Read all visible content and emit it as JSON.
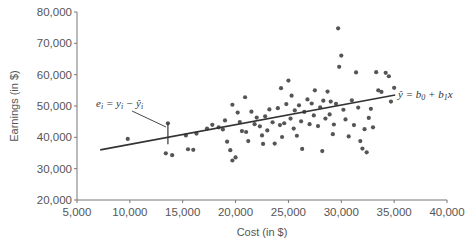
{
  "chart_data": {
    "type": "scatter",
    "title": "",
    "xlabel": "Cost (in $)",
    "ylabel": "Earnings (in $)",
    "xlim": [
      5000,
      40000
    ],
    "ylim": [
      20000,
      80000
    ],
    "x_ticks": [
      "5,000",
      "10,000",
      "15,000",
      "20,000",
      "25,000",
      "30,000",
      "35,000",
      "40,000"
    ],
    "y_ticks": [
      "80,000",
      "70,000",
      "60,000",
      "50,000",
      "40,000",
      "30,000",
      "20,000"
    ],
    "grid": false,
    "legend": null,
    "regression_line": {
      "label": "ŷ = b0 + b1x",
      "x": [
        7200,
        35100
      ],
      "y": [
        36000,
        53500
      ]
    },
    "residual_annotation": {
      "label": "ei = yi − ŷi",
      "x": 13600,
      "y_obs": 44500,
      "y_hat": 37800
    },
    "points": [
      [
        9800,
        39500
      ],
      [
        13600,
        44500
      ],
      [
        13400,
        34900
      ],
      [
        14000,
        34300
      ],
      [
        15500,
        36200
      ],
      [
        15300,
        40600
      ],
      [
        16300,
        41200
      ],
      [
        16000,
        36000
      ],
      [
        17300,
        42800
      ],
      [
        17800,
        44000
      ],
      [
        18400,
        43200
      ],
      [
        18800,
        42500
      ],
      [
        19000,
        45400
      ],
      [
        19200,
        38600
      ],
      [
        19500,
        35900
      ],
      [
        19700,
        32600
      ],
      [
        20000,
        33600
      ],
      [
        19700,
        50400
      ],
      [
        20200,
        47900
      ],
      [
        20400,
        44900
      ],
      [
        20600,
        42000
      ],
      [
        20900,
        52800
      ],
      [
        21000,
        41700
      ],
      [
        21200,
        38800
      ],
      [
        21500,
        48200
      ],
      [
        21800,
        44200
      ],
      [
        22000,
        46300
      ],
      [
        22300,
        43500
      ],
      [
        22500,
        40600
      ],
      [
        22600,
        37900
      ],
      [
        22800,
        46700
      ],
      [
        23000,
        42200
      ],
      [
        23200,
        48900
      ],
      [
        23500,
        44800
      ],
      [
        23700,
        38000
      ],
      [
        24000,
        49300
      ],
      [
        24200,
        43900
      ],
      [
        24300,
        55700
      ],
      [
        24400,
        40100
      ],
      [
        24600,
        44500
      ],
      [
        24800,
        50600
      ],
      [
        25000,
        58100
      ],
      [
        25200,
        46000
      ],
      [
        25300,
        53300
      ],
      [
        25500,
        42800
      ],
      [
        25600,
        48600
      ],
      [
        25800,
        40500
      ],
      [
        26000,
        50200
      ],
      [
        26200,
        45100
      ],
      [
        26300,
        36300
      ],
      [
        26500,
        48100
      ],
      [
        26800,
        52100
      ],
      [
        27000,
        44200
      ],
      [
        27200,
        50800
      ],
      [
        27400,
        47000
      ],
      [
        27500,
        55000
      ],
      [
        27800,
        43600
      ],
      [
        28000,
        49600
      ],
      [
        28200,
        35600
      ],
      [
        28300,
        51700
      ],
      [
        28500,
        46000
      ],
      [
        28700,
        54600
      ],
      [
        28900,
        47300
      ],
      [
        29000,
        51400
      ],
      [
        29200,
        41000
      ],
      [
        29300,
        44100
      ],
      [
        29500,
        50700
      ],
      [
        29700,
        74800
      ],
      [
        29800,
        62500
      ],
      [
        30000,
        66100
      ],
      [
        30200,
        48800
      ],
      [
        30400,
        45700
      ],
      [
        30700,
        40300
      ],
      [
        31000,
        51800
      ],
      [
        31200,
        43900
      ],
      [
        31400,
        60700
      ],
      [
        31600,
        49500
      ],
      [
        31800,
        38800
      ],
      [
        32000,
        36400
      ],
      [
        32200,
        42600
      ],
      [
        32400,
        35200
      ],
      [
        32600,
        46200
      ],
      [
        32800,
        49100
      ],
      [
        33000,
        43200
      ],
      [
        33300,
        60800
      ],
      [
        33500,
        55000
      ],
      [
        33800,
        54500
      ],
      [
        34200,
        60600
      ],
      [
        34500,
        59500
      ],
      [
        34700,
        51400
      ],
      [
        35000,
        55800
      ]
    ]
  },
  "labels": {
    "xlabel": "Cost (in $)",
    "ylabel": "Earnings (in $)",
    "regression_eq_yhat": "ŷ",
    "regression_eq_rest": " = b",
    "residual_eq": "e"
  }
}
